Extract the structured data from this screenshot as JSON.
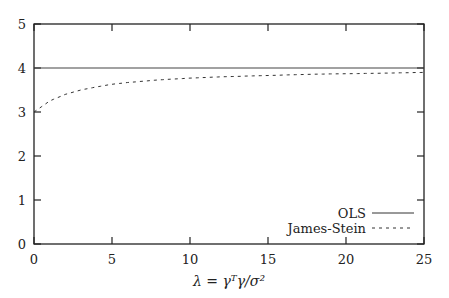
{
  "chart_data": {
    "type": "line",
    "title": "",
    "xlabel": "λ = γᵀγ/σ²",
    "ylabel": "",
    "xlim": [
      0,
      25
    ],
    "ylim": [
      0,
      5
    ],
    "xticks": [
      "0",
      "5",
      "10",
      "15",
      "20",
      "25"
    ],
    "yticks": [
      "0",
      "1",
      "2",
      "3",
      "4",
      "5"
    ],
    "grid": false,
    "legend_position": "lower right",
    "series": [
      {
        "name": "OLS",
        "style": "solid",
        "x": [
          0,
          25
        ],
        "y": [
          4,
          4
        ]
      },
      {
        "name": "James-Stein",
        "style": "dashed",
        "x": [
          0,
          1,
          2,
          3,
          4,
          5,
          6,
          8,
          10,
          12,
          15,
          18,
          20,
          22,
          25
        ],
        "y": [
          3.0,
          3.25,
          3.4,
          3.5,
          3.57,
          3.63,
          3.67,
          3.73,
          3.77,
          3.8,
          3.83,
          3.86,
          3.87,
          3.88,
          3.9
        ]
      }
    ]
  },
  "labels": {
    "xlabel": "λ = γᵀγ/σ²",
    "legend": [
      "OLS",
      "James-Stein"
    ]
  }
}
